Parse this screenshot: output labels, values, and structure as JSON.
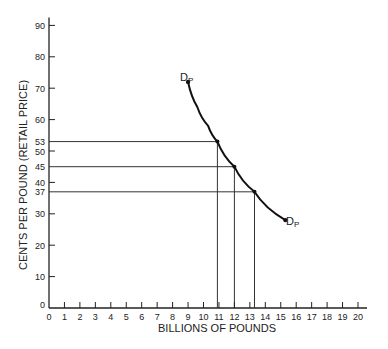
{
  "chart_data": {
    "type": "line",
    "title": "",
    "xlabel": "BILLIONS OF POUNDS",
    "ylabel": "CENTS PER POUND (RETAIL PRICE)",
    "xlim": [
      0,
      20
    ],
    "ylim": [
      0,
      90
    ],
    "xticks": [
      0,
      1,
      2,
      3,
      4,
      5,
      6,
      7,
      8,
      9,
      10,
      11,
      12,
      13,
      14,
      15,
      16,
      17,
      18,
      19,
      20
    ],
    "yticks": [
      0,
      10,
      20,
      30,
      37,
      40,
      45,
      50,
      53,
      60,
      70,
      80,
      90
    ],
    "grid": false,
    "series": [
      {
        "name": "Dp",
        "curve": [
          [
            9.0,
            72
          ],
          [
            9.6,
            64
          ],
          [
            10.3,
            58
          ],
          [
            10.9,
            53
          ],
          [
            12.0,
            45
          ],
          [
            13.3,
            37
          ],
          [
            15.3,
            28
          ]
        ],
        "start_label": "Dp",
        "end_label": "Dp"
      }
    ],
    "reference_points": [
      {
        "x": 10.9,
        "y": 53
      },
      {
        "x": 12.0,
        "y": 45
      },
      {
        "x": 13.3,
        "y": 37
      }
    ]
  },
  "labels": {
    "x_axis": "BILLIONS OF POUNDS",
    "y_axis": "CENTS PER POUND (RETAIL PRICE)",
    "curve_top": "D",
    "curve_bottom": "D",
    "sub": "P"
  }
}
